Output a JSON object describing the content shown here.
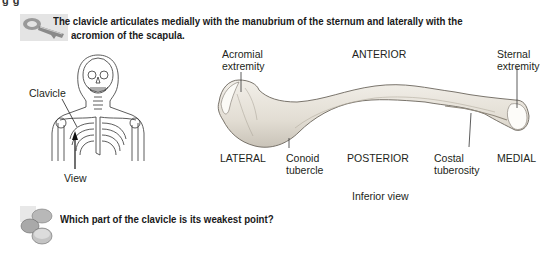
{
  "top_cut_text": "g       g",
  "key_note": {
    "icon": "key-icon",
    "line1": "The clavicle articulates medially with the manubrium of the sternum and laterally with the",
    "line2": "acromion of the scapula."
  },
  "skeleton_figure": {
    "clavicle_label": "Clavicle",
    "view_label": "View"
  },
  "clavicle_figure": {
    "acromial_extremity_1": "Acromial",
    "acromial_extremity_2": "extremity",
    "anterior": "ANTERIOR",
    "sternal_extremity_1": "Sternal",
    "sternal_extremity_2": "extremity",
    "lateral": "LATERAL",
    "conoid_1": "Conoid",
    "conoid_2": "tubercle",
    "posterior": "POSTERIOR",
    "costal_1": "Costal",
    "costal_2": "tuberosity",
    "medial": "MEDIAL",
    "caption": "Inferior view"
  },
  "question": {
    "icon": "question-blocks-icon",
    "text": "Which part of the clavicle is its weakest point?"
  }
}
